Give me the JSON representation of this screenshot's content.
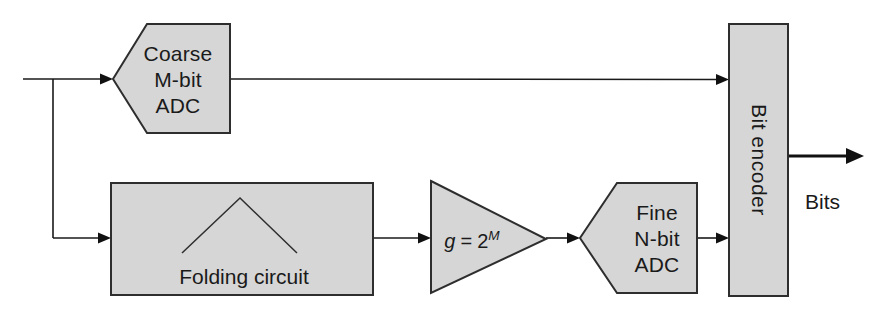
{
  "diagram": {
    "type": "block-diagram",
    "blocks": {
      "coarse_adc": {
        "line1": "Coarse",
        "line2": "M-bit",
        "line3": "ADC"
      },
      "folding_circuit": {
        "label": "Folding circuit"
      },
      "gain_amp": {
        "var": "g",
        "eq": "=",
        "base": "2",
        "exp": "M"
      },
      "fine_adc": {
        "line1": "Fine",
        "line2": "N-bit",
        "line3": "ADC"
      },
      "bit_encoder": {
        "label": "Bit encoder"
      }
    },
    "output_label": "Bits",
    "icons": {
      "folding_waveform": "triangle-peak-wave"
    },
    "colors": {
      "background": "#ffffff",
      "block_fill": "#d6d6d6",
      "block_border": "#2e2e2e",
      "wire": "#1a1a1a",
      "text": "#1a1a1a"
    }
  }
}
